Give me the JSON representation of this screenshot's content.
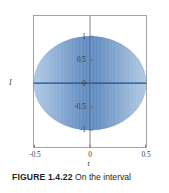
{
  "figure": {
    "caption_label": "FIGURE 1.4.22",
    "caption_text": "On the interval",
    "background_color": "#ffffff",
    "frame_color": "#9a9a9a",
    "axis_line_color": "#6e6e6e",
    "curve_color": "#3a6fb0",
    "curve_color_light": "#9fc0e2",
    "curve_color_dark": "#1f4e87"
  },
  "chart_data": {
    "type": "line",
    "title": "",
    "subtitle": "",
    "xlabel": "t",
    "ylabel": "I",
    "xlim": [
      -0.5,
      0.5
    ],
    "ylim": [
      -1.35,
      1.35
    ],
    "grid": false,
    "legend": null,
    "x_ticks": [
      -0.5,
      0,
      0.5
    ],
    "x_tick_labels": [
      "-0.5",
      "0",
      "0.5"
    ],
    "y_ticks": [
      -1,
      -0.5,
      0,
      0.5,
      1
    ],
    "y_tick_labels": [
      "-1",
      "-0.5",
      "0",
      "0.5",
      "1"
    ],
    "envelope": {
      "type": "elliptical",
      "peak_amplitude": 1,
      "zero_points": [
        -0.5,
        0.5
      ]
    },
    "series": [
      {
        "name": "I(t)",
        "oscillation_cycles": 96,
        "values_note": "amplitude(t) = sqrt(1 - (2t)^2), carrier = sin(2*pi*f*t)"
      }
    ]
  }
}
